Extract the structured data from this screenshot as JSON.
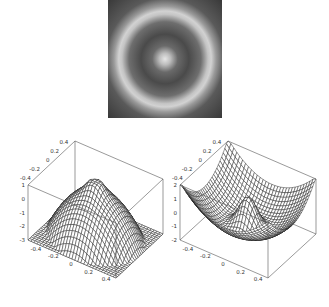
{
  "figure": {
    "panels": 3,
    "background": "#ffffff"
  },
  "chart_data": [
    {
      "type": "heatmap",
      "title": "",
      "description": "Grayscale density image: bright center spot surrounded by a dark band and a bright ring near the edge",
      "colormap": "gray",
      "xlabel": "",
      "ylabel": "",
      "features": {
        "center_spot": "bright",
        "inner_band": "dark",
        "outer_ring": "bright",
        "corners": "dark"
      },
      "ring_radius_fraction": 0.72
    },
    {
      "type": "surface",
      "title": "",
      "style": "wireframe mesh",
      "x_ticks": [
        "-0.4",
        "-0.2",
        "0",
        "0.2",
        "0.4"
      ],
      "y_ticks": [
        "-0.4",
        "-0.2",
        "0",
        "0.2",
        "0.4"
      ],
      "z_ticks": [
        "1",
        "0",
        "-1",
        "-2",
        "-3"
      ],
      "x_range": [
        -0.5,
        0.5
      ],
      "y_range": [
        -0.5,
        0.5
      ],
      "z_range": [
        -3,
        1
      ],
      "shape": "dome (concave down) with a small central peak, low around edges",
      "peak_z": 1,
      "edge_z": -3
    },
    {
      "type": "surface",
      "title": "",
      "style": "wireframe mesh",
      "x_ticks": [
        "-0.4",
        "-0.2",
        "0",
        "0.2",
        "0.4"
      ],
      "y_ticks": [
        "-0.4",
        "-0.2",
        "0",
        "0.2",
        "0.4"
      ],
      "z_ticks": [
        "2",
        "1",
        "0",
        "-1",
        "-2"
      ],
      "x_range": [
        -0.5,
        0.5
      ],
      "y_range": [
        -0.5,
        0.5
      ],
      "z_range": [
        -2,
        2
      ],
      "shape": "bowl (concave up) with a central bump",
      "center_z": 1,
      "edge_z": 2,
      "trough_z": -2
    }
  ],
  "labels": {
    "left": {
      "back_axis": [
        "-0.4",
        "-0.2",
        "0",
        "0.2",
        "0.4"
      ],
      "z_axis": [
        "1",
        "0",
        "-1",
        "-2",
        "-3"
      ],
      "front_axis": [
        "-0.4",
        "-0.2",
        "0",
        "0.2",
        "0.4"
      ]
    },
    "right": {
      "back_axis": [
        "-0.4",
        "-0.2",
        "0",
        "0.2",
        "0.4"
      ],
      "z_axis": [
        "2",
        "1",
        "0",
        "-1",
        "-2"
      ],
      "front_axis": [
        "-0.4",
        "-0.2",
        "0",
        "0.2",
        "0.4"
      ]
    }
  }
}
